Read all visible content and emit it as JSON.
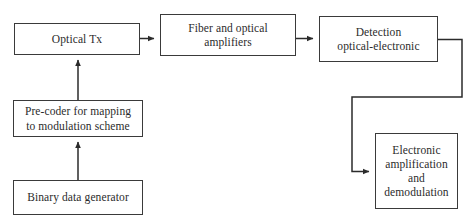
{
  "diagram": {
    "background_color": "#ffffff",
    "line_color": "#3a3a3a",
    "text_color": "#2b2b2b",
    "nodes": [
      {
        "id": "optical-tx",
        "label": "Optical Tx"
      },
      {
        "id": "fiber",
        "label": "Fiber and optical\namplifiers"
      },
      {
        "id": "detection",
        "label": "Detection\noptical-electronic"
      },
      {
        "id": "precoder",
        "label": "Pre-coder for mapping\nto modulation scheme"
      },
      {
        "id": "binary",
        "label": "Binary data generator"
      },
      {
        "id": "electronic",
        "label": "Electronic\namplification\nand\ndemodulation"
      }
    ],
    "connectors": [
      {
        "id": "binary-to-precoder",
        "from": "binary",
        "to": "precoder",
        "direction": "up"
      },
      {
        "id": "precoder-to-optical-tx",
        "from": "precoder",
        "to": "optical-tx",
        "direction": "up"
      },
      {
        "id": "optical-tx-to-fiber",
        "from": "optical-tx",
        "to": "fiber",
        "direction": "right"
      },
      {
        "id": "fiber-to-detection",
        "from": "fiber",
        "to": "detection",
        "direction": "right"
      },
      {
        "id": "detection-to-electronic",
        "from": "detection",
        "to": "electronic",
        "direction": "right-down-left-down-right"
      }
    ]
  }
}
